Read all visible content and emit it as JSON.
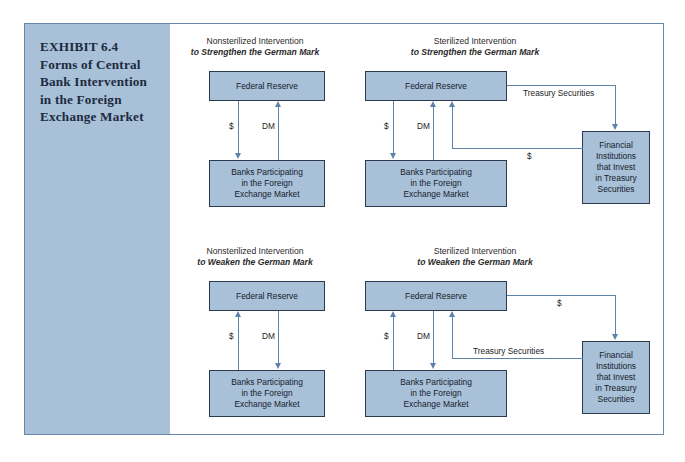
{
  "exhibit": {
    "caption_lines": [
      "EXHIBIT 6.4",
      "Forms of Central",
      "Bank Intervention",
      "in the Foreign",
      "Exchange Market"
    ],
    "colors": {
      "panel_fill": "#a8c0d8",
      "node_fill": "#a8c0d8",
      "node_border": "#2b3a4d",
      "connector": "#5d83ab",
      "frame_border": "#6b86ab",
      "page_background": "#ffffff"
    }
  },
  "nodes": {
    "federal_reserve": "Federal Reserve",
    "banks_line1": "Banks Participating",
    "banks_line2": "in the Foreign",
    "banks_line3": "Exchange Market",
    "fi_line1": "Financial",
    "fi_line2": "Institutions",
    "fi_line3": "that Invest",
    "fi_line4": "in Treasury",
    "fi_line5": "Securities"
  },
  "labels": {
    "dollar": "$",
    "dm": "DM",
    "treasury_securities": "Treasury Securities"
  },
  "quadrants": [
    {
      "id": "nonsterilized-strengthen",
      "heading_line1": "Nonsterilized Intervention",
      "heading_line2": "to Strengthen the German Mark",
      "flows": [
        {
          "label": "$",
          "from": "Federal Reserve",
          "to": "Banks Participating in the Foreign Exchange Market",
          "direction": "down"
        },
        {
          "label": "DM",
          "from": "Banks Participating in the Foreign Exchange Market",
          "to": "Federal Reserve",
          "direction": "up"
        }
      ]
    },
    {
      "id": "sterilized-strengthen",
      "heading_line1": "Sterilized Intervention",
      "heading_line2": "to Strengthen the German Mark",
      "flows": [
        {
          "label": "$",
          "from": "Federal Reserve",
          "to": "Banks Participating in the Foreign Exchange Market",
          "direction": "down"
        },
        {
          "label": "DM",
          "from": "Banks Participating in the Foreign Exchange Market",
          "to": "Federal Reserve",
          "direction": "up"
        },
        {
          "label": "Treasury Securities",
          "from": "Federal Reserve",
          "to": "Financial Institutions that Invest in Treasury Securities",
          "direction": "down"
        },
        {
          "label": "$",
          "from": "Financial Institutions that Invest in Treasury Securities",
          "to": "Federal Reserve",
          "direction": "up"
        }
      ]
    },
    {
      "id": "nonsterilized-weaken",
      "heading_line1": "Nonsterilized Intervention",
      "heading_line2": "to Weaken the German Mark",
      "flows": [
        {
          "label": "$",
          "from": "Banks Participating in the Foreign Exchange Market",
          "to": "Federal Reserve",
          "direction": "up"
        },
        {
          "label": "DM",
          "from": "Federal Reserve",
          "to": "Banks Participating in the Foreign Exchange Market",
          "direction": "down"
        }
      ]
    },
    {
      "id": "sterilized-weaken",
      "heading_line1": "Sterilized Intervention",
      "heading_line2": "to Weaken the German Mark",
      "flows": [
        {
          "label": "$",
          "from": "Banks Participating in the Foreign Exchange Market",
          "to": "Federal Reserve",
          "direction": "up"
        },
        {
          "label": "DM",
          "from": "Federal Reserve",
          "to": "Banks Participating in the Foreign Exchange Market",
          "direction": "down"
        },
        {
          "label": "$",
          "from": "Federal Reserve",
          "to": "Financial Institutions that Invest in Treasury Securities",
          "direction": "down"
        },
        {
          "label": "Treasury Securities",
          "from": "Financial Institutions that Invest in Treasury Securities",
          "to": "Federal Reserve",
          "direction": "up"
        }
      ]
    }
  ]
}
